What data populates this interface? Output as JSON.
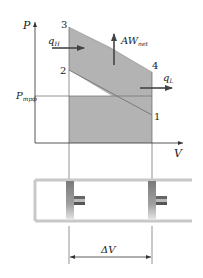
{
  "diagram": {
    "axes": {
      "y_label": "P",
      "x_label": "V"
    },
    "points": [
      {
        "id": "3",
        "label": "3"
      },
      {
        "id": "2",
        "label": "2"
      },
      {
        "id": "4",
        "label": "4"
      },
      {
        "id": "1",
        "label": "1"
      }
    ],
    "reference_pressure": {
      "symbol": "P",
      "subscript": "трф"
    },
    "heat_in": {
      "symbol": "q",
      "subscript": "H"
    },
    "heat_out": {
      "symbol": "q",
      "subscript": "L"
    },
    "net_work": {
      "symbol": "AW",
      "subscript": "net"
    },
    "volume_change": {
      "label": "ΔV"
    },
    "colors": {
      "shaded_region": "#b3b3b3",
      "line": "#555555",
      "arrow": "#444444"
    }
  }
}
